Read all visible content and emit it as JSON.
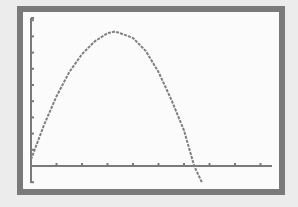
{
  "colors": {
    "background": "#ececec",
    "frame": "#7a7a7a",
    "plot_bg": "#fbfbfb",
    "axis": "#7a7a7a",
    "curve": "#7f7f7f"
  },
  "chart_data": {
    "type": "line",
    "title": "",
    "xlabel": "",
    "ylabel": "",
    "grid": false,
    "legend": null,
    "xlim": [
      0,
      9.5
    ],
    "ylim": [
      -1,
      10
    ],
    "x_ticks": [
      1,
      2,
      3,
      4,
      5,
      6,
      7,
      8,
      9
    ],
    "y_ticks": [
      -1,
      1,
      2,
      3,
      4,
      5,
      6,
      7,
      8,
      9
    ],
    "series": [
      {
        "name": "parabola",
        "x": [
          0,
          0.5,
          1,
          1.5,
          2,
          2.5,
          3,
          3.3,
          3.5,
          4,
          4.5,
          5,
          5.5,
          6,
          6.4,
          6.7
        ],
        "y": [
          0.4,
          2.5,
          4.3,
          5.8,
          6.9,
          7.7,
          8.2,
          8.3,
          8.2,
          7.9,
          7.1,
          5.8,
          4.1,
          2.2,
          0,
          -1.0
        ]
      }
    ],
    "annotations": []
  }
}
